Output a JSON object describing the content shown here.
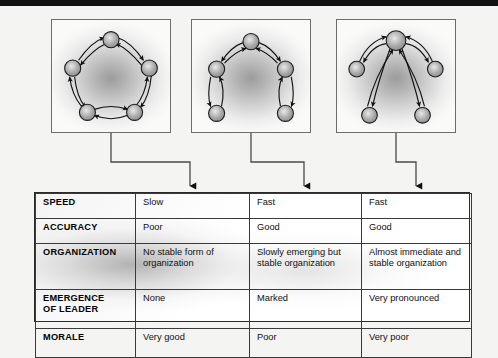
{
  "figure": {
    "type": "communication-network-comparison",
    "top_rule": true,
    "background_color": "#f4f4f2"
  },
  "diagrams": [
    {
      "id": "circle-network",
      "name": "circle",
      "node_count": 5,
      "layout": "pentagon-ring",
      "nodes": [
        {
          "id": "n1",
          "cx": 60,
          "cy": 20
        },
        {
          "id": "n2",
          "cx": 99,
          "cy": 49
        },
        {
          "id": "n3",
          "cx": 84,
          "cy": 94
        },
        {
          "id": "n4",
          "cx": 36,
          "cy": 94
        },
        {
          "id": "n5",
          "cx": 21,
          "cy": 49
        }
      ],
      "links": [
        {
          "from": "n1",
          "to": "n2",
          "bidirectional": true
        },
        {
          "from": "n2",
          "to": "n3",
          "bidirectional": true
        },
        {
          "from": "n3",
          "to": "n4",
          "bidirectional": true
        },
        {
          "from": "n4",
          "to": "n5",
          "bidirectional": true
        },
        {
          "from": "n5",
          "to": "n1",
          "bidirectional": true
        }
      ]
    },
    {
      "id": "chain-network",
      "name": "chain",
      "node_count": 5,
      "layout": "inverted-v-chain",
      "nodes": [
        {
          "id": "m1",
          "cx": 60,
          "cy": 22
        },
        {
          "id": "m2",
          "cx": 25,
          "cy": 50
        },
        {
          "id": "m3",
          "cx": 95,
          "cy": 50
        },
        {
          "id": "m4",
          "cx": 25,
          "cy": 95
        },
        {
          "id": "m5",
          "cx": 95,
          "cy": 95
        }
      ],
      "links": [
        {
          "from": "m1",
          "to": "m2",
          "bidirectional": true
        },
        {
          "from": "m1",
          "to": "m3",
          "bidirectional": true
        },
        {
          "from": "m2",
          "to": "m4",
          "bidirectional": true
        },
        {
          "from": "m3",
          "to": "m5",
          "bidirectional": true
        }
      ]
    },
    {
      "id": "wheel-network",
      "name": "wheel",
      "node_count": 5,
      "layout": "star-centered-hub",
      "nodes": [
        {
          "id": "h",
          "cx": 60,
          "cy": 21,
          "hub": true
        },
        {
          "id": "p1",
          "cx": 20,
          "cy": 50
        },
        {
          "id": "p2",
          "cx": 100,
          "cy": 50
        },
        {
          "id": "p3",
          "cx": 33,
          "cy": 97
        },
        {
          "id": "p4",
          "cx": 87,
          "cy": 97
        }
      ],
      "links": [
        {
          "from": "h",
          "to": "p1",
          "bidirectional": true
        },
        {
          "from": "h",
          "to": "p2",
          "bidirectional": true
        },
        {
          "from": "h",
          "to": "p3",
          "bidirectional": true
        },
        {
          "from": "h",
          "to": "p4",
          "bidirectional": true
        }
      ]
    }
  ],
  "table": {
    "row_labels": [
      "SPEED",
      "ACCURACY",
      "ORGANIZATION",
      "EMERGENCE OF LEADER",
      "MORALE"
    ],
    "rows": [
      {
        "label": "SPEED",
        "label_lines": [
          "SPEED"
        ],
        "cells": [
          "Slow",
          "Fast",
          "Fast"
        ]
      },
      {
        "label": "ACCURACY",
        "label_lines": [
          "ACCURACY"
        ],
        "cells": [
          "Poor",
          "Good",
          "Good"
        ]
      },
      {
        "label": "ORGANIZATION",
        "label_lines": [
          "ORGANIZATION"
        ],
        "cells": [
          "No stable form of organization",
          "Slowly emerging but stable organization",
          "Almost immediate and stable organization"
        ]
      },
      {
        "label": "EMERGENCE OF LEADER",
        "label_lines": [
          "EMERGENCE",
          "OF LEADER"
        ],
        "cells": [
          "None",
          "Marked",
          "Very pronounced"
        ]
      },
      {
        "label": "MORALE",
        "label_lines": [
          "MORALE"
        ],
        "cells": [
          "Very good",
          "Poor",
          "Very poor"
        ]
      }
    ]
  },
  "connectors": {
    "count": 3,
    "style": "elbow-with-arrowhead",
    "description": "each diagram box connects down and across to its table column"
  }
}
